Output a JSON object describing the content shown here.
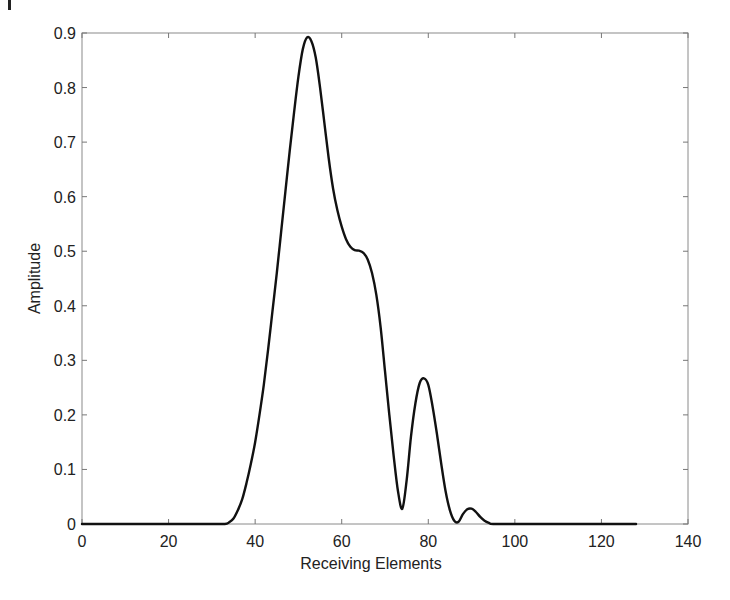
{
  "chart_data": {
    "type": "line",
    "title": "",
    "xlabel": "Receiving Elements",
    "ylabel": "Amplitude",
    "xlim": [
      0,
      140
    ],
    "ylim": [
      0,
      0.9
    ],
    "xticks": [
      0,
      20,
      40,
      60,
      80,
      100,
      120,
      140
    ],
    "xtick_labels": [
      "0",
      "20",
      "40",
      "60",
      "80",
      "100",
      "120",
      "140"
    ],
    "yticks": [
      0,
      0.1,
      0.2,
      0.3,
      0.4,
      0.5,
      0.6,
      0.7,
      0.8,
      0.9
    ],
    "ytick_labels": [
      "0",
      "0.1",
      "0.2",
      "0.3",
      "0.4",
      "0.5",
      "0.6",
      "0.7",
      "0.8",
      "0.9"
    ],
    "grid": false,
    "legend": null,
    "series": [
      {
        "name": "amplitude",
        "color": "#111111",
        "x": [
          0,
          10,
          20,
          30,
          33,
          34,
          35,
          36,
          37,
          38,
          39,
          40,
          41,
          42,
          43,
          44,
          45,
          46,
          47,
          48,
          49,
          50,
          51,
          52,
          53,
          54,
          55,
          56,
          57,
          58,
          59,
          60,
          61,
          62,
          63,
          64,
          65,
          66,
          67,
          68,
          69,
          70,
          71,
          72,
          73,
          74,
          75,
          76,
          77,
          78,
          79,
          80,
          81,
          82,
          83,
          84,
          85,
          86,
          87,
          88,
          89,
          90,
          91,
          92,
          93,
          94,
          95,
          100,
          110,
          120,
          128
        ],
        "y": [
          0,
          0,
          0,
          0,
          0,
          0.003,
          0.01,
          0.025,
          0.045,
          0.075,
          0.11,
          0.15,
          0.2,
          0.255,
          0.32,
          0.39,
          0.46,
          0.535,
          0.61,
          0.685,
          0.755,
          0.82,
          0.87,
          0.892,
          0.885,
          0.855,
          0.8,
          0.735,
          0.67,
          0.615,
          0.575,
          0.545,
          0.522,
          0.508,
          0.502,
          0.501,
          0.497,
          0.485,
          0.46,
          0.42,
          0.36,
          0.28,
          0.2,
          0.125,
          0.06,
          0.028,
          0.08,
          0.16,
          0.22,
          0.258,
          0.267,
          0.255,
          0.215,
          0.165,
          0.11,
          0.06,
          0.025,
          0.006,
          0.004,
          0.018,
          0.027,
          0.028,
          0.022,
          0.013,
          0.006,
          0.002,
          0,
          0,
          0,
          0,
          0
        ]
      }
    ]
  }
}
